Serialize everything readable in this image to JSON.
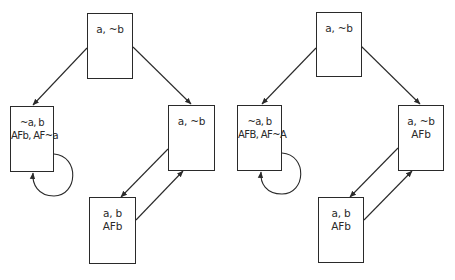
{
  "diagrams": [
    {
      "id": "left",
      "nodes": [
        {
          "name": "top",
          "lines": [
            "a, ~b"
          ]
        },
        {
          "name": "left",
          "lines": [
            "~a, b",
            "AFb, AF~a"
          ]
        },
        {
          "name": "right",
          "lines": [
            "a, ~b"
          ]
        },
        {
          "name": "bottom",
          "lines": [
            "a, b",
            "AFb"
          ]
        }
      ]
    },
    {
      "id": "right",
      "nodes": [
        {
          "name": "top",
          "lines": [
            "a, ~b"
          ]
        },
        {
          "name": "left",
          "lines": [
            "~a, b",
            "AFB, AF~A"
          ]
        },
        {
          "name": "right",
          "lines": [
            "a, ~b",
            "AFb"
          ]
        },
        {
          "name": "bottom",
          "lines": [
            "a, b",
            "AFb"
          ]
        }
      ]
    }
  ],
  "colors": {
    "stroke": "#2a2a2a",
    "background": "#ffffff"
  }
}
